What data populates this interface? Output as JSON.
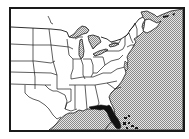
{
  "map": {
    "title": "Eastern United States locator map",
    "highlighted_region": "Florida",
    "colors": {
      "land": "#ffffff",
      "border": "#1a1a1a",
      "highlight": "#111111",
      "water_base": "#e6e6e6",
      "water_dot": "#8a8a8a"
    },
    "water_bodies": [
      "Atlantic Ocean",
      "Gulf of Mexico",
      "Great Lakes"
    ],
    "labels": []
  }
}
